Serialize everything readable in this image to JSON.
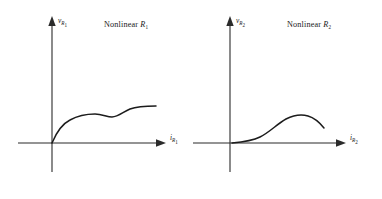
{
  "figure": {
    "background_color": "#ffffff",
    "ink_color": "#1c1c1c",
    "axis_color": "#2b2b2b",
    "panels": [
      {
        "id": "panel-1",
        "title_prefix": "Nonlinear",
        "title_symbol": "R",
        "title_subscript": "1",
        "title_full": "Nonlinear R1",
        "vertical_axis": {
          "symbol": "v",
          "subscript": "R",
          "subscript2": "1",
          "label_full": "vR1"
        },
        "horizontal_axis": {
          "symbol": "i",
          "subscript": "R",
          "subscript2": "1",
          "label_full": "iR1"
        },
        "curve_description": "monotonic increasing with inflection plateau",
        "curve_path": "M 52 143 C 57 131 62 124 70 120 C 79 115 88 114 95 114 C 102 114 107 117 112 117 C 118 117 123 112 130 109 C 138 106 147 106 156 106"
      },
      {
        "id": "panel-2",
        "title_prefix": "Nonlinear",
        "title_symbol": "R",
        "title_subscript": "2",
        "title_full": "Nonlinear R2",
        "vertical_axis": {
          "symbol": "v",
          "subscript": "R",
          "subscript2": "2",
          "label_full": "vR2"
        },
        "horizontal_axis": {
          "symbol": "i",
          "subscript": "R",
          "subscript2": "2",
          "label_full": "iR2"
        },
        "curve_description": "S-shaped rise to local maximum then decreasing",
        "curve_path": "M 232 143 C 243 142 252 141 260 137 C 270 132 277 124 286 119 C 294 115 301 114 308 116 C 315 118 320 123 324 128"
      }
    ]
  },
  "chart_data": [
    {
      "type": "line",
      "title": "Nonlinear R1",
      "xlabel": "iR1",
      "ylabel": "vR1",
      "grid": false,
      "legend": "none",
      "xlim": [
        0,
        1
      ],
      "ylim": [
        0,
        1
      ],
      "x": [
        0.0,
        0.05,
        0.1,
        0.17,
        0.25,
        0.35,
        0.45,
        0.55,
        0.62,
        0.72,
        0.82,
        0.92,
        1.0
      ],
      "y": [
        0.0,
        0.17,
        0.3,
        0.42,
        0.5,
        0.54,
        0.555,
        0.55,
        0.56,
        0.62,
        0.68,
        0.71,
        0.72
      ],
      "annotations": [
        "monotonically increasing",
        "plateau near mid-range",
        "second rise to saturation"
      ]
    },
    {
      "type": "line",
      "title": "Nonlinear R2",
      "xlabel": "iR2",
      "ylabel": "vR2",
      "grid": false,
      "legend": "none",
      "xlim": [
        0,
        1
      ],
      "ylim": [
        0,
        1
      ],
      "x": [
        0.0,
        0.1,
        0.2,
        0.3,
        0.4,
        0.5,
        0.6,
        0.7,
        0.78,
        0.87,
        1.0
      ],
      "y": [
        0.0,
        0.02,
        0.05,
        0.12,
        0.25,
        0.4,
        0.52,
        0.58,
        0.59,
        0.55,
        0.43
      ],
      "annotations": [
        "flat near origin",
        "S-shaped rise",
        "local maximum then decreasing"
      ]
    }
  ]
}
